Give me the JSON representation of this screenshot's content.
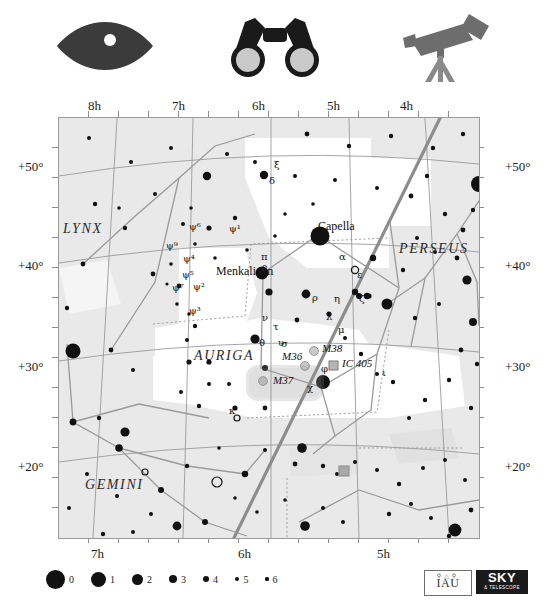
{
  "top_icons": [
    {
      "name": "eye-icon",
      "label": "naked eye"
    },
    {
      "name": "binoculars-icon",
      "label": "binoculars"
    },
    {
      "name": "telescope-icon",
      "label": "telescope"
    }
  ],
  "chart": {
    "ra_axis_top": [
      "8h",
      "7h",
      "6h",
      "5h",
      "4h"
    ],
    "ra_axis_bottom": [
      "7h",
      "6h",
      "5h"
    ],
    "dec_axis_left": [
      "+50°",
      "+40°",
      "+30°",
      "+20°"
    ],
    "dec_axis_right": [
      "+50°",
      "+40°",
      "+30°",
      "+20°"
    ],
    "background_color": "#e9e9e9",
    "milkyway_color": "#ffffff",
    "border_color": "#9a9a9a",
    "star_color": "#111111",
    "line_color": "#8f8f8f",
    "constellations": [
      {
        "name": "LYNX",
        "x": 62,
        "y": 228
      },
      {
        "name": "AURIGA",
        "x": 193,
        "y": 355
      },
      {
        "name": "PERSEUS",
        "x": 398,
        "y": 248
      },
      {
        "name": "GEMINI",
        "x": 84,
        "y": 484
      }
    ],
    "named_stars": [
      {
        "name": "Capella",
        "x": 317,
        "y": 234
      },
      {
        "name": "Menkalinan",
        "x": 215,
        "y": 271
      }
    ],
    "greek_labels": [
      {
        "text": "α",
        "x": 338,
        "y": 250
      },
      {
        "text": "β",
        "x": 261,
        "y": 262
      },
      {
        "text": "δ",
        "x": 268,
        "y": 174
      },
      {
        "text": "ε",
        "x": 356,
        "y": 268
      },
      {
        "text": "ζ",
        "x": 358,
        "y": 292
      },
      {
        "text": "η",
        "x": 333,
        "y": 292
      },
      {
        "text": "θ",
        "x": 258,
        "y": 336
      },
      {
        "text": "ι",
        "x": 381,
        "y": 366
      },
      {
        "text": "κ",
        "x": 228,
        "y": 404
      },
      {
        "text": "λ",
        "x": 325,
        "y": 310
      },
      {
        "text": "μ",
        "x": 337,
        "y": 323
      },
      {
        "text": "ν",
        "x": 261,
        "y": 311
      },
      {
        "text": "ξ",
        "x": 273,
        "y": 158
      },
      {
        "text": "π",
        "x": 260,
        "y": 250
      },
      {
        "text": "ρ",
        "x": 311,
        "y": 291
      },
      {
        "text": "σ",
        "x": 280,
        "y": 337
      },
      {
        "text": "τ",
        "x": 272,
        "y": 320
      },
      {
        "text": "υ",
        "x": 277,
        "y": 336
      },
      {
        "text": "φ",
        "x": 320,
        "y": 362
      },
      {
        "text": "χ",
        "x": 306,
        "y": 381
      },
      {
        "text": "ψ¹",
        "x": 228,
        "y": 222
      },
      {
        "text": "ψ²",
        "x": 192,
        "y": 280
      },
      {
        "text": "ψ³",
        "x": 188,
        "y": 304
      },
      {
        "text": "ψ⁴",
        "x": 182,
        "y": 252
      },
      {
        "text": "ψ⁵",
        "x": 181,
        "y": 268
      },
      {
        "text": "ψ⁶",
        "x": 188,
        "y": 220
      },
      {
        "text": "ψ⁷",
        "x": 171,
        "y": 281
      },
      {
        "text": "ψ⁹",
        "x": 165,
        "y": 239
      }
    ],
    "deep_sky": [
      {
        "name": "M36",
        "x": 281,
        "y": 357,
        "marker_x": 304,
        "marker_y": 365,
        "type": "cluster"
      },
      {
        "name": "M37",
        "x": 272,
        "y": 381,
        "marker_x": 262,
        "marker_y": 380,
        "type": "cluster",
        "highlighted": true
      },
      {
        "name": "M38",
        "x": 321,
        "y": 349,
        "marker_x": 313,
        "marker_y": 350,
        "type": "cluster"
      },
      {
        "name": "IC 405",
        "x": 341,
        "y": 364,
        "marker_x": 332,
        "marker_y": 364,
        "type": "nebula"
      }
    ]
  },
  "legend": {
    "caption": "magnitude scale",
    "items": [
      {
        "mag": "0",
        "r": 9.5
      },
      {
        "mag": "1",
        "r": 7.5
      },
      {
        "mag": "2",
        "r": 5.5
      },
      {
        "mag": "3",
        "r": 4.0
      },
      {
        "mag": "4",
        "r": 3.0
      },
      {
        "mag": "5",
        "r": 2.2
      },
      {
        "mag": "6",
        "r": 1.6
      }
    ]
  },
  "logos": {
    "iau": "IAU",
    "sky": "SKY",
    "sky_sub": "& TELESCOPE"
  }
}
